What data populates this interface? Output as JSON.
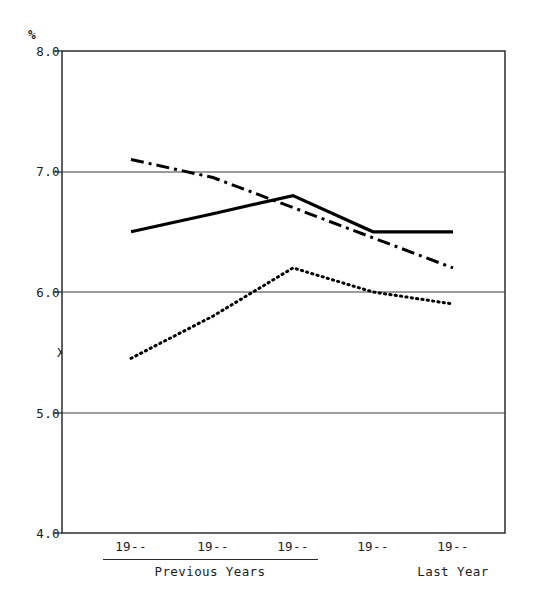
{
  "chart_data": {
    "type": "line",
    "title": "",
    "subtitle": "",
    "ylabel": "%",
    "xlabel": "",
    "ylim": [
      4.0,
      8.0
    ],
    "y_ticks": [
      "8.0",
      "7.0",
      "6.0",
      "5.0",
      "4.0"
    ],
    "y_tick_values": [
      8.0,
      7.0,
      6.0,
      5.0,
      4.0
    ],
    "grid": true,
    "grid_axis": "y",
    "legend_position": "inline-left",
    "categories": [
      "19--",
      "19--",
      "19--",
      "19--",
      "19--"
    ],
    "x_group_labels": [
      {
        "label": "Previous Years",
        "spans_categories": [
          0,
          1,
          2,
          3
        ],
        "underlined": true
      },
      {
        "label": "Last Year",
        "spans_categories": [
          4
        ],
        "underlined": false
      }
    ],
    "series": [
      {
        "name": "B Corp.",
        "label": "B Corp.",
        "style": "dash-dot",
        "color": "#000000",
        "values": [
          7.1,
          6.95,
          6.7,
          6.45,
          6.2
        ]
      },
      {
        "name": "A Corp.",
        "label": "A Corp.",
        "style": "solid",
        "color": "#000000",
        "values": [
          6.5,
          6.65,
          6.8,
          6.5,
          6.5
        ]
      },
      {
        "name": "XYZ Corp.",
        "label": "XYZ Corp.",
        "style": "dotted",
        "color": "#000000",
        "values": [
          5.45,
          5.8,
          6.2,
          6.0,
          5.9
        ]
      }
    ]
  },
  "axes": {
    "unit_symbol": "%",
    "frame_color": "#1f1f1f",
    "grid_color": "#3a3a3a",
    "background": "#ffffff"
  },
  "legend_inline": [
    {
      "key": "B Corp.",
      "text": "B Corp."
    },
    {
      "key": "A Corp.",
      "text": "A Corp."
    },
    {
      "key": "XYZ Corp.",
      "text": "XYZ Corp."
    }
  ]
}
